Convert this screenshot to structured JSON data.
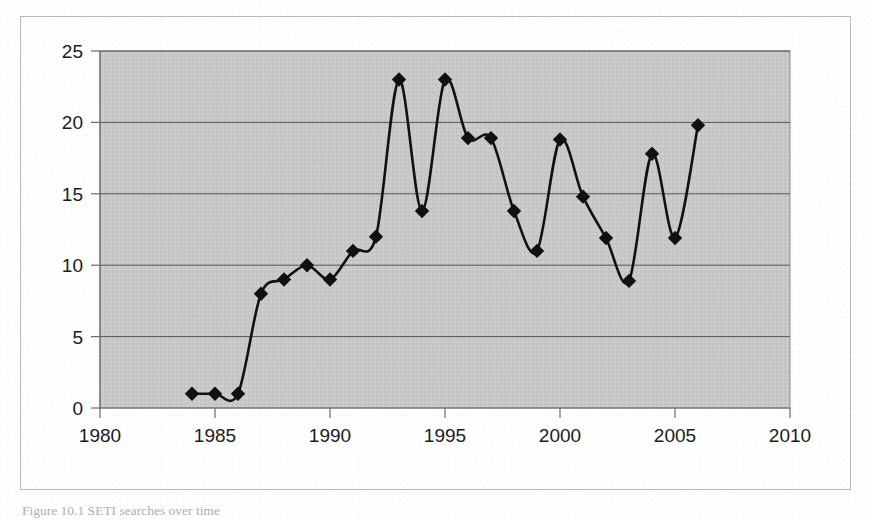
{
  "figure": {
    "caption": "Figure 10.1   SETI searches over time",
    "background_color": "#ffffff",
    "frame_color": "#b9b9b9"
  },
  "chart_data": {
    "type": "line",
    "title": "",
    "subtitle": "",
    "xlabel": "",
    "ylabel": "",
    "xlim": [
      1980,
      2010
    ],
    "ylim": [
      0,
      25
    ],
    "xticks": [
      "1980",
      "1985",
      "1990",
      "1995",
      "2000",
      "2005",
      "2010"
    ],
    "xtick_values": [
      1980,
      1985,
      1990,
      1995,
      2000,
      2005,
      2010
    ],
    "yticks": [
      "0",
      "5",
      "10",
      "15",
      "20",
      "25"
    ],
    "ytick_values": [
      0,
      5,
      10,
      15,
      20,
      25
    ],
    "grid": "horizontal",
    "legend": "none",
    "plot_background_color": "#c9c9c9",
    "gridline_color": "#555555",
    "series_color": "#111111",
    "marker": "diamond",
    "x": [
      1984,
      1985,
      1986,
      1987,
      1988,
      1989,
      1990,
      1991,
      1992,
      1993,
      1994,
      1995,
      1996,
      1997,
      1998,
      1999,
      2000,
      2001,
      2002,
      2003,
      2004,
      2005,
      2006
    ],
    "values": [
      1,
      1,
      1,
      8,
      9,
      10,
      9,
      11,
      12,
      23,
      13.8,
      23,
      18.9,
      18.9,
      13.8,
      11,
      18.8,
      14.8,
      11.9,
      8.9,
      17.8,
      11.9,
      19.8
    ],
    "series": [
      {
        "name": "searches",
        "x": [
          1984,
          1985,
          1986,
          1987,
          1988,
          1989,
          1990,
          1991,
          1992,
          1993,
          1994,
          1995,
          1996,
          1997,
          1998,
          1999,
          2000,
          2001,
          2002,
          2003,
          2004,
          2005,
          2006
        ],
        "values": [
          1,
          1,
          1,
          8,
          9,
          10,
          9,
          11,
          12,
          23,
          13.8,
          23,
          18.9,
          18.9,
          13.8,
          11,
          18.8,
          14.8,
          11.9,
          8.9,
          17.8,
          11.9,
          19.8
        ]
      }
    ]
  }
}
